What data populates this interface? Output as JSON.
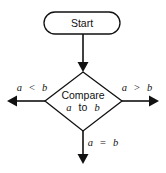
{
  "diagram": {
    "type": "flowchart",
    "nodes": {
      "start": {
        "shape": "terminator",
        "label": "Start"
      },
      "compare": {
        "shape": "decision",
        "line1": "Compare",
        "line2": {
          "var1": "a",
          "word": "to",
          "var2": "b"
        }
      }
    },
    "edges": {
      "start_to_compare": {
        "from": "start",
        "to": "compare",
        "label": ""
      },
      "less": {
        "from": "compare",
        "direction": "left",
        "label": {
          "lhs": "a",
          "op": "<",
          "rhs": "b"
        }
      },
      "greater": {
        "from": "compare",
        "direction": "right",
        "label": {
          "lhs": "a",
          "op": ">",
          "rhs": "b"
        }
      },
      "equal": {
        "from": "compare",
        "direction": "down",
        "label": {
          "lhs": "a",
          "op": "=",
          "rhs": "b"
        }
      }
    },
    "colors": {
      "stroke": "#111111",
      "fill": "#ffffff",
      "text": "#111111"
    }
  }
}
